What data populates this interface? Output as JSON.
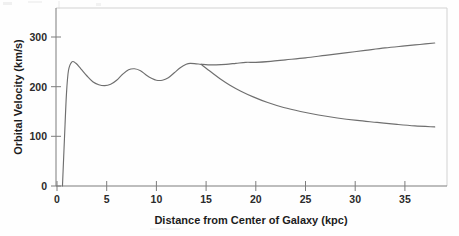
{
  "chart_data": {
    "type": "line",
    "title": "",
    "xlabel": "Distance from Center of Galaxy (kpc)",
    "ylabel": "Orbital Velocity (km/s)",
    "xlim": [
      0,
      39.2
    ],
    "ylim": [
      0,
      358
    ],
    "xticks": [
      0,
      5,
      10,
      15,
      20,
      25,
      30,
      35
    ],
    "xtick_labels": [
      "0",
      "5",
      "10",
      "15",
      "20",
      "25",
      "30",
      "35"
    ],
    "yticks": [
      0,
      100,
      200,
      300
    ],
    "ytick_labels": [
      "0",
      "100",
      "200",
      "300"
    ],
    "grid": false,
    "legend": null,
    "line_color": "#6f6f6f",
    "axis_color": "#7c7c7c",
    "series": [
      {
        "name": "observed-rotation-curve",
        "description": "Measured galactic rotation curve: steep inner rise, damped oscillations, then flat and slowly rising outward",
        "x": [
          0.55,
          0.75,
          0.95,
          1.15,
          1.5,
          1.9,
          2.4,
          3.0,
          3.6,
          4.2,
          4.8,
          5.4,
          6.0,
          6.6,
          7.2,
          7.8,
          8.4,
          9.0,
          9.5,
          10.0,
          10.6,
          11.2,
          11.8,
          12.4,
          13.0,
          13.4,
          14.0,
          14.5,
          15.2,
          16.0,
          17.0,
          18.0,
          19.0,
          20.0,
          21.5,
          23.0,
          25.0,
          27.0,
          29.0,
          31.0,
          33.0,
          35.0,
          36.5,
          38.0
        ],
        "y": [
          0,
          95,
          185,
          232,
          250,
          247,
          236,
          222,
          210,
          204,
          202,
          205,
          213,
          225,
          234,
          236,
          232,
          223,
          217,
          213,
          213,
          218,
          228,
          238,
          245,
          247,
          246,
          245,
          244,
          244,
          245,
          247,
          249,
          249,
          251,
          254,
          258,
          263,
          268,
          273,
          278,
          282,
          285,
          288
        ]
      },
      {
        "name": "keplerian-decline",
        "description": "Predicted Keplerian fall-off from visible mass, branching at about 14.5 kpc",
        "x": [
          14.5,
          15.0,
          15.6,
          16.4,
          17.4,
          18.5,
          19.8,
          21.2,
          22.8,
          24.5,
          26.3,
          28.2,
          30.2,
          32.2,
          34.2,
          36.0,
          38.0
        ],
        "y": [
          245,
          237,
          228,
          216,
          203,
          191,
          179,
          168,
          158,
          150,
          143,
          137,
          132,
          128,
          124,
          121,
          119
        ]
      }
    ],
    "annotations": [
      {
        "label": "branch-point",
        "x": 14.5,
        "y": 245
      }
    ]
  },
  "axis_titles": {
    "x": "Distance from Center of Galaxy (kpc)",
    "y": "Orbital Velocity (km/s)"
  }
}
